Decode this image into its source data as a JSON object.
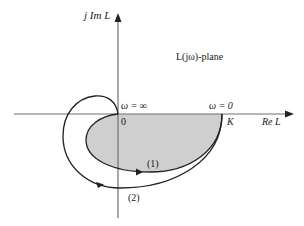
{
  "diagram": {
    "axes": {
      "imag_label": "j Im L",
      "real_label": "Re L"
    },
    "plane_label": "L(jω)-plane",
    "points": {
      "origin_label": "0",
      "k_label": "K",
      "omega_inf_label": "ω = ∞",
      "omega_zero_label": "ω = 0"
    },
    "curves": [
      {
        "id": "curve-1",
        "label": "(1)",
        "shaded": true
      },
      {
        "id": "curve-2",
        "label": "(2)",
        "shaded": false
      }
    ],
    "colors": {
      "axis": "#707070",
      "curve": "#222222",
      "fill": "#cfcfcf",
      "text": "#1a1a1a"
    }
  }
}
